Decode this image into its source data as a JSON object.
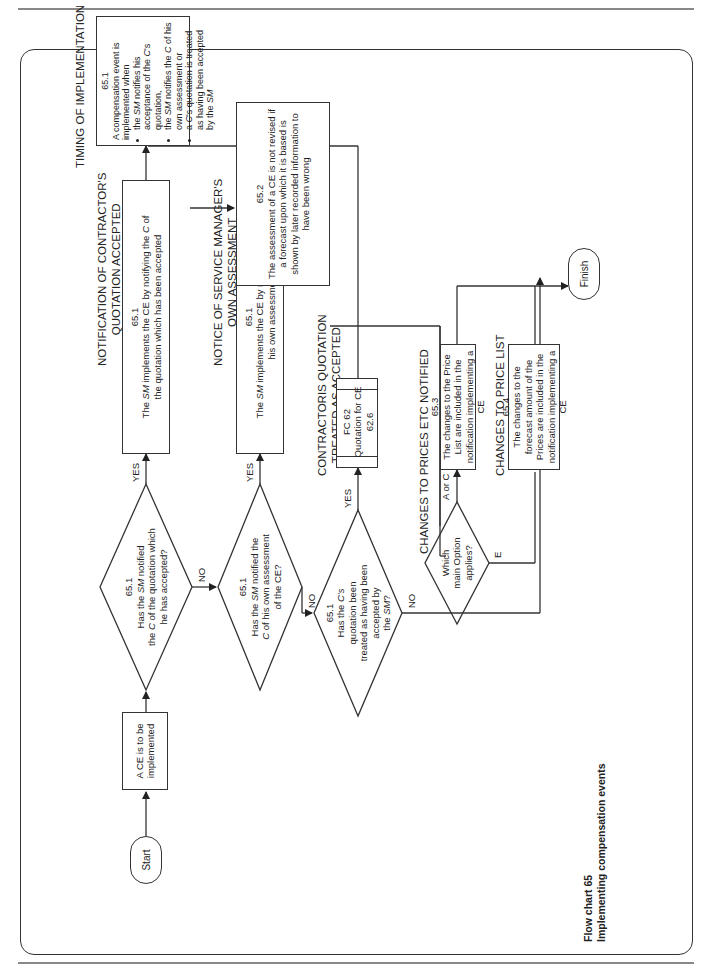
{
  "caption": {
    "line1": "Flow chart 65",
    "line2": "Implementing compensation events"
  },
  "terminals": {
    "start": "Start",
    "finish": "Finish"
  },
  "process_start": {
    "text": "A CE is to be implemented"
  },
  "decisions": [
    {
      "id": "d1",
      "ref": "65.1",
      "lines": [
        "Has the SM notified",
        "the C of the quotation which",
        "he has accepted?"
      ],
      "yes_label": "YES",
      "no_label": "NO"
    },
    {
      "id": "d2",
      "ref": "65.1",
      "lines": [
        "Has the SM notified the",
        "C of his own assessment",
        "of the CE?"
      ],
      "yes_label": "YES",
      "no_label": "NO"
    },
    {
      "id": "d3",
      "ref": "65.1",
      "lines": [
        "Has the C's",
        "quotation been",
        "treated as having been",
        "accepted by",
        "the SM?"
      ],
      "yes_label": "YES",
      "no_label": "NO"
    },
    {
      "id": "d4",
      "lines": [
        "Which",
        "main Option",
        "applies?"
      ],
      "branch_ac_label": "A or C",
      "branch_e_label": "E"
    }
  ],
  "headings": {
    "contractor_quotation": [
      "NOTIFICATION OF CONTRACTOR'S",
      "QUOTATION ACCEPTED"
    ],
    "sm_assessment": [
      "NOTICE OF SERVICE MANAGER'S",
      "OWN ASSESSMENT"
    ],
    "treated_accepted": [
      "CONTRACTORIS QUOTATION",
      "TREATED AS ACCEPTED"
    ],
    "timing": "TIMING OF IMPLEMENTATION",
    "not_revised": [
      "ASSESSMENT",
      "NOT REVISED"
    ],
    "prices_notified": "CHANGES TO PRICES ETC NOTIFIED",
    "price_list": "CHANGES TO PRICE LIST"
  },
  "boxes": {
    "quotation_accepted": {
      "ref": "65.1",
      "text": "The SM implements the CE by notifying the C of the quotation which has been accepted"
    },
    "own_assessment": {
      "ref": "65.1",
      "text": "The SM implements the CE by notifying the C of his own assessment"
    },
    "fc62": {
      "ref": "FC 62",
      "title": "Quotation for CE",
      "clause": "62.6"
    },
    "timing": {
      "ref": "65.1",
      "intro": "A compensation event is implemented when",
      "bullets": [
        "the SM notifies his acceptance of the C's quotation,",
        "the SM notifies the C of his own assessment or",
        "a C's quotation is treated as having been accepted by the SM"
      ]
    },
    "not_revised": {
      "ref": "65.2",
      "text": "The assessment of a CE is not revised if a forecast upon which it is based is shown by later recorded information to have been wrong"
    },
    "price_list_ac": {
      "ref": "65.3",
      "text": "The changes to the Price List are included in the notification implementing a CE"
    },
    "prices_e": {
      "ref": "65.4",
      "text": "The changes to the forecast amount of the Prices are included in the notification implementing a CE"
    }
  }
}
